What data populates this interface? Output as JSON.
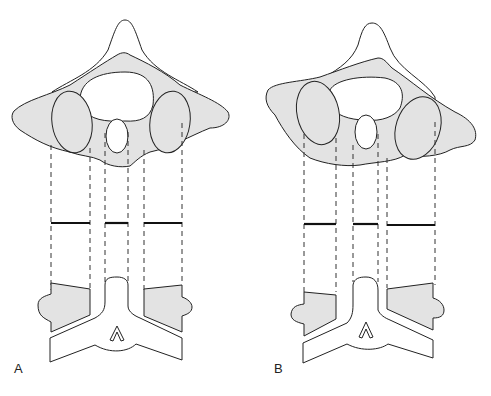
{
  "figure": {
    "type": "anatomical-line-drawing",
    "panels": [
      {
        "id": "A",
        "label": "A",
        "description": "Axial vertebra outline with symmetric shaded lateral masses, projected down via dashed lines to three bold measurement bars and a lower coronal-view section"
      },
      {
        "id": "B",
        "label": "B",
        "description": "Same vertebra rotated/tilted, asymmetric lateral masses, projected to measurement bars of unequal length and lower coronal-view section"
      }
    ],
    "colors": {
      "shading": "#e3e3e3",
      "line": "#222222",
      "background": "#ffffff"
    }
  }
}
